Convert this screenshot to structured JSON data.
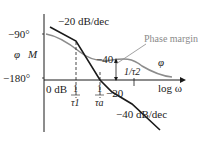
{
  "diagram": {
    "type": "bode-plot",
    "axes": {
      "x_label": "log ω",
      "y_label_phase": "φ",
      "y_label_mag": "M",
      "y_ticks": [
        "−90°",
        "−180°"
      ],
      "zero_db_label": "0 dB"
    },
    "frequency_marks": [
      {
        "num": "1",
        "den": "τ1"
      },
      {
        "num": "1",
        "den": "τa"
      },
      {
        "label": "1/τ2"
      }
    ],
    "slope_labels": {
      "top": "−20 dB/dec",
      "middle": "−40",
      "lower": "−20",
      "bottom": "−40 dB/dec"
    },
    "annotations": {
      "phase_margin": "Phase margin",
      "phase_curve": "φ"
    },
    "colors": {
      "magnitude": "#1a1a1a",
      "phase": "#8c8c8c",
      "axis": "#1a1a1a",
      "annotation": "#8a8a8a"
    }
  }
}
